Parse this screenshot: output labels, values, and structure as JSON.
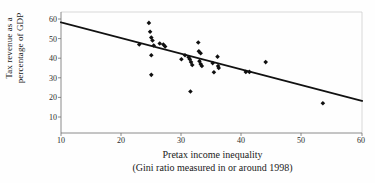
{
  "chart_data": {
    "type": "scatter",
    "title": "",
    "xlabel": "Pretax income inequality",
    "xlabel_line2": "(Gini ratio measured in or around 1998)",
    "ylabel": "Tax revenue as a",
    "ylabel_line2": "percentage of GDP",
    "xlim": [
      10,
      60
    ],
    "ylim": [
      0,
      60
    ],
    "xticks": [
      10,
      20,
      30,
      40,
      50,
      60
    ],
    "yticks": [
      10,
      20,
      30,
      40,
      50,
      60
    ],
    "grid": false,
    "legend": "none",
    "marker": "filled-diamond",
    "marker_color": "#101010",
    "points": [
      {
        "x": 23.0,
        "y": 47.0
      },
      {
        "x": 24.6,
        "y": 58.0
      },
      {
        "x": 24.8,
        "y": 53.5
      },
      {
        "x": 25.0,
        "y": 50.5
      },
      {
        "x": 25.2,
        "y": 49.0
      },
      {
        "x": 25.4,
        "y": 46.5
      },
      {
        "x": 25.0,
        "y": 41.5
      },
      {
        "x": 25.0,
        "y": 31.5
      },
      {
        "x": 26.4,
        "y": 47.5
      },
      {
        "x": 27.0,
        "y": 47.0
      },
      {
        "x": 27.3,
        "y": 46.0
      },
      {
        "x": 30.0,
        "y": 39.5
      },
      {
        "x": 30.6,
        "y": 41.5
      },
      {
        "x": 31.2,
        "y": 40.5
      },
      {
        "x": 31.4,
        "y": 39.5
      },
      {
        "x": 31.6,
        "y": 38.0
      },
      {
        "x": 31.8,
        "y": 36.5
      },
      {
        "x": 31.5,
        "y": 23.0
      },
      {
        "x": 32.8,
        "y": 48.0
      },
      {
        "x": 32.9,
        "y": 43.5
      },
      {
        "x": 33.2,
        "y": 42.5
      },
      {
        "x": 33.0,
        "y": 38.5
      },
      {
        "x": 33.2,
        "y": 37.0
      },
      {
        "x": 33.4,
        "y": 36.0
      },
      {
        "x": 35.2,
        "y": 37.5
      },
      {
        "x": 35.4,
        "y": 32.8
      },
      {
        "x": 36.0,
        "y": 40.8
      },
      {
        "x": 36.1,
        "y": 36.0
      },
      {
        "x": 36.2,
        "y": 35.0
      },
      {
        "x": 40.7,
        "y": 33.0
      },
      {
        "x": 41.3,
        "y": 33.0
      },
      {
        "x": 44.0,
        "y": 38.0
      },
      {
        "x": 53.5,
        "y": 17.0
      }
    ],
    "trendline": {
      "type": "linear-fit",
      "x_start": 10,
      "y_start": 58.3,
      "x_end": 60,
      "y_end": 18.2
    }
  }
}
